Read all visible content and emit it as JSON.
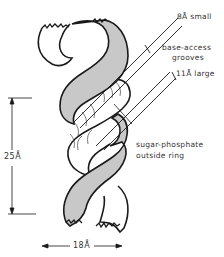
{
  "diagram": {
    "colors": {
      "shaded_strand": "#c8c8c8",
      "outline": "#1a1a1a",
      "background": "#ffffff"
    },
    "labels": {
      "small_groove": "8Å small",
      "grooves_line1": "base-access",
      "grooves_line2": "grooves",
      "large_groove": "11Å large",
      "backbone_line1": "sugar-phosphate",
      "backbone_line2": "outside ring",
      "pitch": "25Å",
      "diameter": "18Å"
    }
  }
}
